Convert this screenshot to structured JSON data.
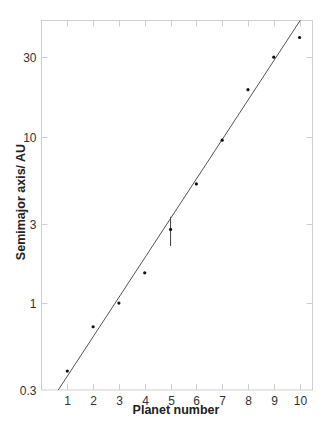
{
  "chart_data": {
    "type": "scatter",
    "title": "",
    "xlabel": "Planet number",
    "ylabel": "Semimajor axis/ AU",
    "xscale": "linear",
    "yscale": "log",
    "xlim": [
      0,
      10.5
    ],
    "ylim": [
      0.3,
      50
    ],
    "grid": false,
    "legend": null,
    "x_ticks": [
      1,
      2,
      3,
      4,
      5,
      6,
      7,
      8,
      9,
      10
    ],
    "x_tick_labels": [
      "1",
      "2",
      "3",
      "4",
      "5",
      "6",
      "7",
      "8",
      "9",
      "10"
    ],
    "y_ticks": [
      0.3,
      1,
      3,
      10,
      30
    ],
    "y_tick_labels": [
      "0.3",
      "1",
      "3",
      "10",
      "30"
    ],
    "series": [
      {
        "name": "Planets",
        "kind": "points",
        "x": [
          1,
          2,
          3,
          4,
          5,
          6,
          7,
          8,
          9,
          10
        ],
        "y": [
          0.39,
          0.72,
          1.0,
          1.52,
          2.77,
          5.2,
          9.54,
          19.2,
          30.1,
          39.5
        ],
        "error_bars": [
          {
            "index": 4,
            "low": 2.2,
            "high": 3.3
          }
        ]
      },
      {
        "name": "Fit",
        "kind": "line",
        "x": [
          0.65,
          10.02
        ],
        "y": [
          0.3,
          50
        ]
      }
    ]
  }
}
